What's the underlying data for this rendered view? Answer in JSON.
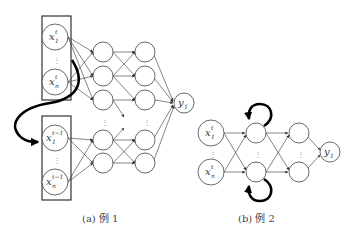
{
  "diagram": {
    "example_a": {
      "caption": "(a) 例 1",
      "inputs_t": [
        {
          "base": "x",
          "sub": "1",
          "sup": "t"
        },
        {
          "base": "x",
          "sub": "n",
          "sup": "t"
        }
      ],
      "inputs_t_minus_1": [
        {
          "base": "x",
          "sub": "1",
          "sup": "t−1"
        },
        {
          "base": "x",
          "sub": "n",
          "sup": "t−1"
        }
      ],
      "output": {
        "base": "y",
        "sub": "1"
      },
      "ellipsis": "⋮"
    },
    "example_b": {
      "caption": "(b) 例 2",
      "inputs": [
        {
          "base": "x",
          "sub": "1",
          "sup": "t"
        },
        {
          "base": "x",
          "sub": "n",
          "sup": "t"
        }
      ],
      "output": {
        "base": "y",
        "sub": "1"
      },
      "ellipsis": "⋮"
    }
  }
}
